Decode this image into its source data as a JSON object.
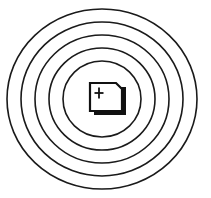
{
  "canvas": {
    "width": 211,
    "height": 198,
    "background": "#ffffff"
  },
  "icon": {
    "name": "new-window-target-icon",
    "title": "",
    "description": "Concentric rings surrounding a card with a plus sign",
    "stroke_color": "#1a1a1a",
    "fill_color": "#ffffff",
    "shadow_color": "#111111",
    "center": {
      "x": 102,
      "y": 99
    },
    "rings": [
      {
        "label": "ring-1-outermost",
        "rx": 95,
        "ry": 90,
        "stroke_width": 1.6
      },
      {
        "label": "ring-2",
        "rx": 81,
        "ry": 77,
        "stroke_width": 1.6
      },
      {
        "label": "ring-3",
        "rx": 67,
        "ry": 64,
        "stroke_width": 1.6
      },
      {
        "label": "ring-4",
        "rx": 53,
        "ry": 51,
        "stroke_width": 1.6
      },
      {
        "label": "ring-5-innermost",
        "rx": 39,
        "ry": 38,
        "stroke_width": 1.6
      }
    ],
    "card": {
      "label": "card-with-plus",
      "x": 90,
      "y": 83,
      "width": 32,
      "height": 28,
      "corner_notch": 6,
      "shadow_offset_x": 4,
      "shadow_offset_y": 4
    },
    "plus": {
      "label": "plus-sign",
      "center_x": 99,
      "center_y": 93,
      "arm_length": 9,
      "stroke_width": 1.8
    }
  }
}
